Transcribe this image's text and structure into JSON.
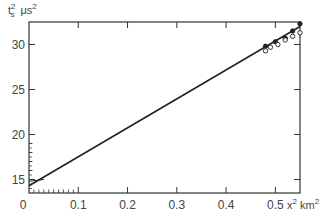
{
  "chart_data": {
    "type": "scatter",
    "title": "",
    "xlabel": "x² km²",
    "ylabel": "t_s² μs²",
    "xlim": [
      0,
      0.55
    ],
    "ylim": [
      13.5,
      32.5
    ],
    "grid": false,
    "legend": null,
    "x_ticks": [
      0,
      0.1,
      0.2,
      0.3,
      0.4,
      0.5
    ],
    "x_tick_labels": [
      "0",
      "0.1",
      "0.2",
      "0.3",
      "0.4",
      "0.5"
    ],
    "y_ticks": [
      15,
      20,
      25,
      30
    ],
    "y_tick_labels": [
      "15",
      "20",
      "25",
      "30"
    ],
    "series": [
      {
        "name": "fit line",
        "kind": "line",
        "x": [
          0,
          0.55
        ],
        "y": [
          14.3,
          32.0
        ]
      },
      {
        "name": "filled points",
        "kind": "scatter",
        "marker": "filled-circle",
        "x": [
          0.48,
          0.5,
          0.52,
          0.535,
          0.55
        ],
        "y": [
          29.8,
          30.3,
          30.7,
          31.5,
          32.3
        ]
      },
      {
        "name": "open points",
        "kind": "scatter",
        "marker": "open-circle",
        "x": [
          0.48,
          0.49,
          0.505,
          0.52,
          0.535,
          0.55
        ],
        "y": [
          29.3,
          29.7,
          30.0,
          30.5,
          30.9,
          31.3
        ]
      }
    ]
  },
  "labels": {
    "y_axis_main": "t",
    "y_axis_sup": "2",
    "y_axis_sub": "s",
    "y_axis_unit": "μs",
    "y_axis_unit_sup": "2",
    "x_axis_var": "x",
    "x_axis_var_sup": "2",
    "x_axis_unit": "km",
    "x_axis_unit_sup": "2",
    "origin": "0"
  }
}
